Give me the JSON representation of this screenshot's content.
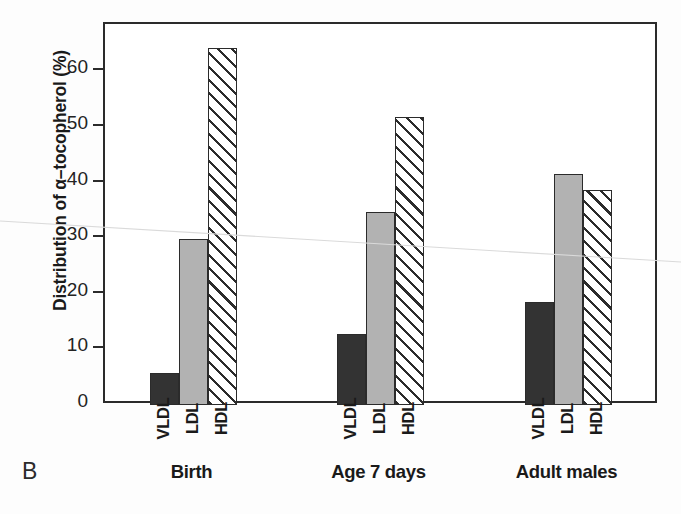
{
  "panel": {
    "letter": "B"
  },
  "chart_data": {
    "type": "bar",
    "title": "",
    "xlabel": "",
    "ylabel": "Distribution of α–tocopherol (%)",
    "ylim": [
      0,
      68.5
    ],
    "yticks": [
      0,
      10,
      20,
      30,
      40,
      50,
      60
    ],
    "ytick_labels": [
      "0",
      "10",
      "20",
      "30",
      "40",
      "50",
      "60"
    ],
    "grid": false,
    "legend": "none",
    "categories": [
      "VLDL",
      "LDL",
      "HDL"
    ],
    "groups": [
      "Birth",
      "Age 7 days",
      "Adult males"
    ],
    "series": [
      {
        "name": "VLDL",
        "fill": "dark",
        "values": [
          5.8,
          12.7,
          18.6
        ]
      },
      {
        "name": "LDL",
        "fill": "gray",
        "values": [
          29.8,
          34.7,
          41.6
        ]
      },
      {
        "name": "HDL",
        "fill": "hatch",
        "values": [
          64.1,
          51.8,
          38.6
        ]
      }
    ],
    "bars": [
      {
        "group": "Birth",
        "category": "VLDL",
        "value": 5.8,
        "fill": "dark"
      },
      {
        "group": "Birth",
        "category": "LDL",
        "value": 29.8,
        "fill": "gray"
      },
      {
        "group": "Birth",
        "category": "HDL",
        "value": 64.1,
        "fill": "hatch"
      },
      {
        "group": "Age 7 days",
        "category": "VLDL",
        "value": 12.7,
        "fill": "dark"
      },
      {
        "group": "Age 7 days",
        "category": "LDL",
        "value": 34.7,
        "fill": "gray"
      },
      {
        "group": "Age 7 days",
        "category": "HDL",
        "value": 51.8,
        "fill": "hatch"
      },
      {
        "group": "Adult males",
        "category": "VLDL",
        "value": 18.6,
        "fill": "dark"
      },
      {
        "group": "Adult males",
        "category": "LDL",
        "value": 41.6,
        "fill": "gray"
      },
      {
        "group": "Adult males",
        "category": "HDL",
        "value": 38.6,
        "fill": "hatch"
      }
    ],
    "colors": {
      "dark": "#333333",
      "gray": "#b2b2b2",
      "hatch": "#ffffff",
      "outline": "#2b2b2b",
      "axis": "#2b2b2b"
    }
  }
}
